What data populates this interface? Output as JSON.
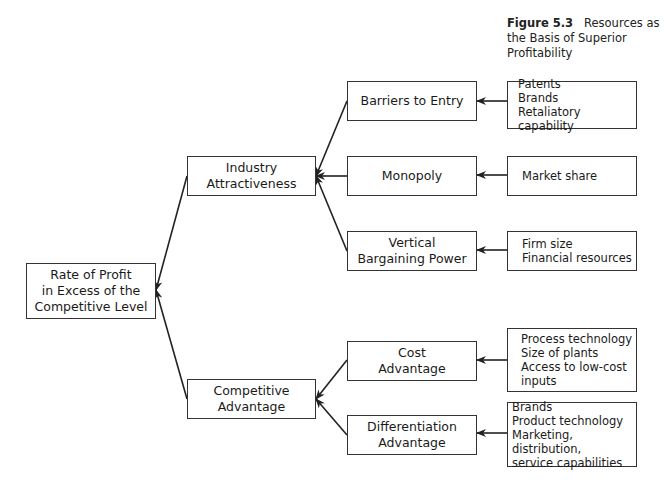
{
  "caption": {
    "figure_label": "Figure 5.3",
    "title": "Resources as the Basis of Superior Profitability"
  },
  "nodes": {
    "root": "Rate of Profit\nin Excess of the\nCompetitive Level",
    "industry": "Industry\nAttractiveness",
    "competitive": "Competitive\nAdvantage",
    "barriers": "Barriers to Entry",
    "monopoly": "Monopoly",
    "vertical": "Vertical\nBargaining Power",
    "cost": "Cost\nAdvantage",
    "differentiation": "Differentiation\nAdvantage"
  },
  "resources": {
    "barriers": "Patents\nBrands\nRetaliatory capability",
    "monopoly": "Market share",
    "vertical": "Firm size\nFinancial resources",
    "cost": "Process technology\nSize of plants\nAccess to low-cost\n      inputs",
    "differentiation": "Brands\nProduct technology\nMarketing, distribution,\n    service capabilities"
  }
}
